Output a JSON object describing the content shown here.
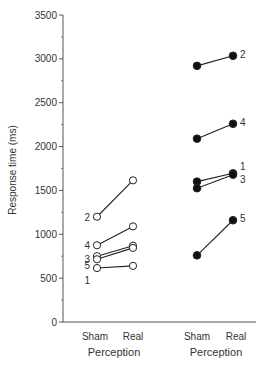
{
  "chart_data": {
    "type": "line",
    "title": "",
    "ylabel": "Response time (ms)",
    "ylim": [
      0,
      3500
    ],
    "yticks": [
      0,
      500,
      1000,
      1500,
      2000,
      2500,
      3000,
      3500
    ],
    "grid": false,
    "legend": "none",
    "groups": [
      {
        "name": "Perception",
        "marker": "open-circle",
        "categories": [
          "Sham",
          "Real"
        ],
        "series": [
          {
            "name": "2",
            "values": [
              1200,
              1615
            ]
          },
          {
            "name": "4",
            "values": [
              875,
              1090
            ]
          },
          {
            "name": "3",
            "values": [
              750,
              870
            ]
          },
          {
            "name": "5",
            "values": [
              715,
              845
            ]
          },
          {
            "name": "1",
            "values": [
              615,
              640
            ]
          }
        ],
        "labels_side": "left",
        "label_order": [
          "2",
          "4",
          "3",
          "5",
          "1"
        ]
      },
      {
        "name": "Perception",
        "marker": "filled-circle",
        "categories": [
          "Sham",
          "Real"
        ],
        "series": [
          {
            "name": "2",
            "values": [
              2920,
              3035
            ]
          },
          {
            "name": "4",
            "values": [
              2090,
              2260
            ]
          },
          {
            "name": "1",
            "values": [
              1600,
              1695
            ]
          },
          {
            "name": "3",
            "values": [
              1525,
              1680
            ]
          },
          {
            "name": "5",
            "values": [
              760,
              1160
            ]
          }
        ],
        "labels_side": "right"
      }
    ]
  },
  "axis": {
    "ylabel": "Response time (ms)",
    "group1_xlabel": "Perception",
    "group2_xlabel": "Perception",
    "cat_sham": "Sham",
    "cat_real": "Real"
  }
}
